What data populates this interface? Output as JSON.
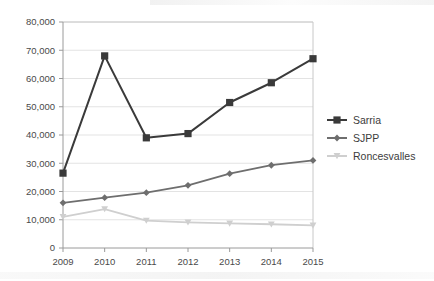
{
  "chart_data": {
    "type": "line",
    "title": "",
    "xlabel": "",
    "ylabel": "",
    "categories": [
      "2009",
      "2010",
      "2011",
      "2012",
      "2013",
      "2014",
      "2015"
    ],
    "ylim": [
      0,
      80000
    ],
    "yticks": [
      0,
      10000,
      20000,
      30000,
      40000,
      50000,
      60000,
      70000,
      80000
    ],
    "ytick_labels": [
      "0",
      "10,000",
      "20,000",
      "30,000",
      "40,000",
      "50,000",
      "60,000",
      "70,000",
      "80,000"
    ],
    "grid": true,
    "legend_position": "right",
    "series": [
      {
        "name": "Sarria",
        "color": "#3a3a3a",
        "marker": "square",
        "values": [
          26500,
          68000,
          39000,
          40500,
          51500,
          58500,
          67000
        ]
      },
      {
        "name": "SJPP",
        "color": "#6e6e6e",
        "marker": "diamond",
        "values": [
          16000,
          17800,
          19600,
          22200,
          26300,
          29300,
          31000
        ]
      },
      {
        "name": "Roncesvalles",
        "color": "#cfcfcf",
        "marker": "triangle-down",
        "values": [
          11000,
          13800,
          9700,
          9100,
          8700,
          8400,
          8000
        ]
      }
    ]
  },
  "plot": {
    "border_color": "#c8c8c8",
    "grid_color": "#e3e3e3",
    "axis_color": "#9a9a9a",
    "background": "#ffffff"
  },
  "legend": {
    "entries": [
      {
        "label": "Sarria"
      },
      {
        "label": "SJPP"
      },
      {
        "label": "Roncesvalles"
      }
    ]
  }
}
